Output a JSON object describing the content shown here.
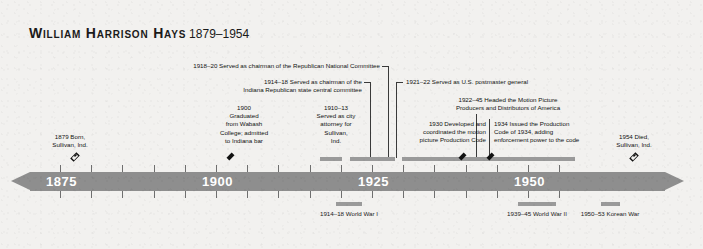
{
  "title": {
    "name": "William Harrison Hays",
    "years": "1879–1954"
  },
  "axis": {
    "ticks": [
      1875,
      1880,
      1885,
      1890,
      1895,
      1900,
      1905,
      1910,
      1915,
      1920,
      1925,
      1930,
      1935,
      1940,
      1945,
      1950,
      1955
    ],
    "labels": [
      {
        "text": "1875",
        "year": 1875
      },
      {
        "text": "1900",
        "year": 1900
      },
      {
        "text": "1925",
        "year": 1925
      },
      {
        "text": "1950",
        "year": 1950
      }
    ],
    "range": [
      1872,
      1957
    ]
  },
  "life_events": [
    {
      "id": "born",
      "marker": "open-diamond",
      "year": 1879,
      "text": "1879 Born,\nSullivan, Ind."
    },
    {
      "id": "died",
      "marker": "open-diamond",
      "year": 1954,
      "text": "1954 Died,\nSullivan, Ind."
    }
  ],
  "events": [
    {
      "id": "graduated",
      "marker": "solid-diamond",
      "year": 1900,
      "text": "1900\nGraduated\nfrom Wabash\nCollege; admitted\nto Indiana bar"
    },
    {
      "id": "city-attorney",
      "marker": "span",
      "span": [
        1910,
        1913
      ],
      "text": "1910–13\nServed as city\nattorney for\nSullivan,\nInd."
    },
    {
      "id": "indiana-gop-chairman",
      "marker": "span",
      "span": [
        1914,
        1918
      ],
      "text": "1914–18 Served as chairman of the\nIndiana Republican state central committee"
    },
    {
      "id": "rnc-chairman",
      "marker": "span",
      "span": [
        1918,
        1920
      ],
      "text": "1918–20 Served as chairman of the Republican National Committee"
    },
    {
      "id": "postmaster-general",
      "marker": "span",
      "span": [
        1921,
        1922
      ],
      "text": "1921–22 Served as U.S. postmaster general"
    },
    {
      "id": "mppda-head",
      "marker": "span",
      "span": [
        1922,
        1945
      ],
      "text": "1922–45 Headed the Motion Picture\nProducers and Distributors of America"
    },
    {
      "id": "production-code-developed",
      "marker": "solid-diamond",
      "year": 1930,
      "text": "1930 Developed and\ncoordinated the motion\npicture Production Code"
    },
    {
      "id": "production-code-1934",
      "marker": "solid-diamond",
      "year": 1934,
      "text": "1934 Issued the Production\nCode of 1934, adding\nenforcement power to the code"
    }
  ],
  "wars": [
    {
      "id": "ww1",
      "span": [
        1914,
        1918
      ],
      "text": "1914–18\nWorld War I"
    },
    {
      "id": "ww2",
      "span": [
        1939,
        1945
      ],
      "text": "1939–45\nWorld War II"
    },
    {
      "id": "korea",
      "span": [
        1950,
        1953
      ],
      "text": "1950–53\nKorean War"
    }
  ],
  "colors": {
    "background": "#f2f1ef",
    "axis_bar": "#8e8e8e",
    "span_bar": "#9a9a9a",
    "marker": "#111111",
    "axis_label": "#ffffff"
  }
}
